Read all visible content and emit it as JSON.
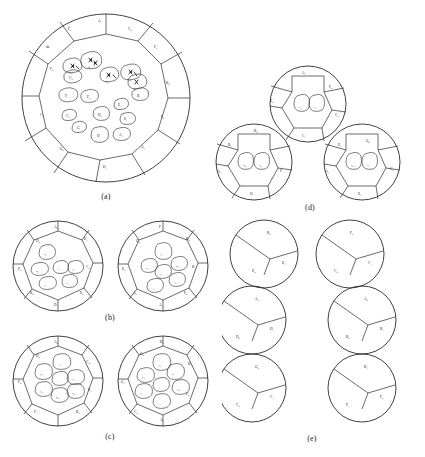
{
  "figure": {
    "panels": [
      {
        "id": "a",
        "caption": "(a)",
        "type": "single-disc",
        "outer_labels": [
          "F4",
          "C3",
          "G2",
          "D3",
          "A2",
          "E2",
          "B2",
          "F3",
          "C4",
          "A3",
          "F2",
          "ab"
        ],
        "inner_labels": [
          "F1",
          "F5",
          "C5",
          "G",
          "C2",
          "D2",
          "D1",
          "A1",
          "E1",
          "E3",
          "B1",
          "F6",
          "ab1",
          "ab2",
          "ab3",
          "ab4"
        ]
      },
      {
        "id": "b",
        "caption": "(b)",
        "type": "two-discs",
        "discs": [
          {
            "outer_labels": [
              "D2",
              "C2",
              "E2",
              "B2",
              "D3",
              "F2",
              "A2",
              "E3"
            ],
            "inner_labels": [
              "D1",
              "C",
              "C1",
              "E1",
              "B1",
              "F1"
            ]
          },
          {
            "outer_labels": [
              "F",
              "B2",
              "B1",
              "F2",
              "A1",
              "A2",
              "G2",
              "E2"
            ],
            "inner_labels": [
              "G1",
              "B1",
              "C1",
              "F1",
              "A1",
              "E1"
            ]
          }
        ]
      },
      {
        "id": "c",
        "caption": "(c)",
        "type": "two-discs",
        "discs": [
          {
            "outer_labels": [
              "D2",
              "C4",
              "E1",
              "F4",
              "A2",
              "B2",
              "F1",
              "C2"
            ],
            "inner_labels": [
              "A1",
              "D1",
              "A",
              "E1",
              "C1",
              "B2",
              "E2"
            ]
          },
          {
            "outer_labels": [
              "G2",
              "G1",
              "B1",
              "F2",
              "A1",
              "C2",
              "B2",
              "E2"
            ],
            "inner_labels": [
              "A",
              "B",
              "F2",
              "A1",
              "C1",
              "G1"
            ]
          }
        ]
      },
      {
        "id": "d",
        "caption": "(d)",
        "type": "three-discs",
        "discs": [
          {
            "position": "top",
            "outer_labels": [
              "A1",
              "F2",
              "C2",
              "C1",
              "E2"
            ],
            "inner_labels": [
              "E1",
              "F1"
            ]
          },
          {
            "position": "bottom-left",
            "outer_labels": [
              "B1",
              "B2",
              "F1",
              "D1",
              "A2"
            ],
            "inner_labels": [
              "D2",
              "E2"
            ]
          },
          {
            "position": "bottom-right",
            "outer_labels": [
              "E1",
              "G2",
              "A2",
              "C2",
              "E3"
            ],
            "inner_labels": [
              "E4",
              "G1"
            ]
          }
        ]
      },
      {
        "id": "e",
        "caption": "(e)",
        "type": "six-discs",
        "discs": [
          {
            "position": "left-top",
            "labels": [
              "B2",
              "E2",
              "E1"
            ]
          },
          {
            "position": "left-middle",
            "labels": [
              "A2",
              "D2",
              "D1"
            ]
          },
          {
            "position": "left-bottom",
            "labels": [
              "G2",
              "C2",
              "C1"
            ]
          },
          {
            "position": "right-top",
            "labels": [
              "F2",
              "C2",
              "C1"
            ]
          },
          {
            "position": "right-middle",
            "labels": [
              "A2",
              "B2",
              "B1"
            ]
          },
          {
            "position": "right-bottom",
            "labels": [
              "B1",
              "F1",
              "F2"
            ]
          }
        ]
      }
    ]
  },
  "colors": {
    "stroke": "#2b2b2b",
    "label": "#151515",
    "background": "#ffffff"
  }
}
